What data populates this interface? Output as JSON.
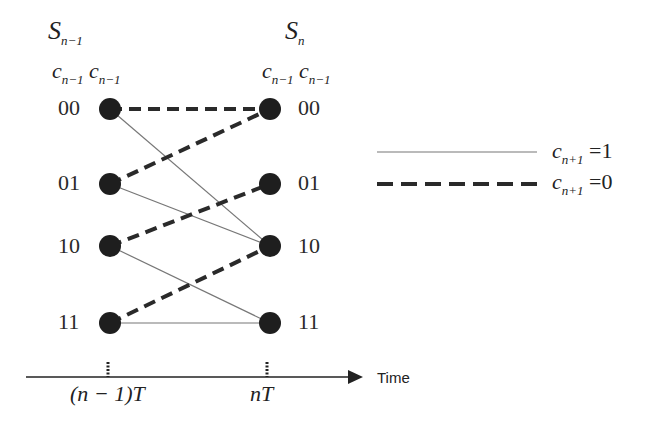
{
  "diagram": {
    "type": "trellis",
    "left_stage": {
      "title": {
        "main": "S",
        "sub": "n−1"
      },
      "bits_header": [
        {
          "main": "c",
          "sub": "n−1"
        },
        {
          "main": "c",
          "sub": "n−1"
        }
      ],
      "states": [
        "00",
        "01",
        "10",
        "11"
      ]
    },
    "right_stage": {
      "title": {
        "main": "S",
        "sub": "n"
      },
      "bits_header": [
        {
          "main": "c",
          "sub": "n−1"
        },
        {
          "main": "c",
          "sub": "n−1"
        }
      ],
      "states": [
        "00",
        "01",
        "10",
        "11"
      ]
    },
    "transitions": [
      {
        "from": "00",
        "to": "00",
        "style": "dashed",
        "input": 0
      },
      {
        "from": "00",
        "to": "10",
        "style": "solid",
        "input": 1
      },
      {
        "from": "01",
        "to": "00",
        "style": "dashed",
        "input": 0
      },
      {
        "from": "01",
        "to": "10",
        "style": "solid",
        "input": 1
      },
      {
        "from": "10",
        "to": "01",
        "style": "dashed",
        "input": 0
      },
      {
        "from": "10",
        "to": "11",
        "style": "solid",
        "input": 1
      },
      {
        "from": "11",
        "to": "10",
        "style": "dashed",
        "input": 0
      },
      {
        "from": "11",
        "to": "11",
        "style": "solid",
        "input": 1
      }
    ],
    "legend": [
      {
        "style": "solid",
        "label": {
          "main": "c",
          "sub": "n+1",
          "eq": "=1"
        }
      },
      {
        "style": "dashed",
        "label": {
          "main": "c",
          "sub": "n+1",
          "eq": "=0"
        }
      }
    ],
    "time_axis": {
      "label": "Time",
      "ticks": [
        {
          "label_paren": "(n − 1)",
          "label_tail": "T"
        },
        {
          "label_paren": "",
          "label_tail": "nT"
        }
      ]
    }
  }
}
